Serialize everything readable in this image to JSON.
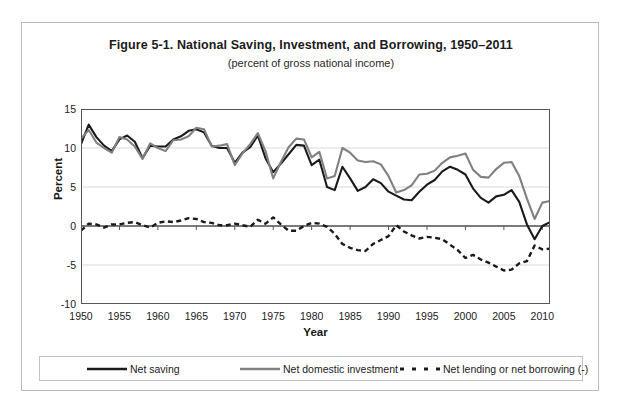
{
  "figure": {
    "title": "Figure 5-1. National Saving, Investment, and Borrowing, 1950–2011",
    "subtitle": "(percent of gross national income)"
  },
  "colors": {
    "net_saving": "#1a1a1a",
    "net_domestic_investment": "#808080",
    "net_lending_or_borrowing": "#1a1a1a",
    "axis": "#555555",
    "gridline": "#d9d9d9",
    "frame": "#b9b9b9",
    "text": "#1b1b1b"
  },
  "chart_data": {
    "type": "line",
    "title": "Figure 5-1. National Saving, Investment, and Borrowing, 1950–2011",
    "subtitle": "(percent of gross national income)",
    "xlabel": "Year",
    "ylabel": "Percent",
    "xlim": [
      1950,
      2011
    ],
    "ylim": [
      -10,
      15
    ],
    "yticks": [
      15,
      10,
      5,
      0,
      -5,
      -10
    ],
    "ytick_labels": [
      "15",
      "10",
      "5",
      "0",
      "-5",
      "-10"
    ],
    "xticks": [
      1950,
      1955,
      1960,
      1965,
      1970,
      1975,
      1980,
      1985,
      1990,
      1995,
      2000,
      2005,
      2010
    ],
    "xtick_labels": [
      "1950",
      "1955",
      "1960",
      "1965",
      "1970",
      "1975",
      "1980",
      "1985",
      "1990",
      "1995",
      "2000",
      "2005",
      "2010"
    ],
    "grid": "horizontal",
    "legend_position": "bottom",
    "x": [
      1950,
      1951,
      1952,
      1953,
      1954,
      1955,
      1956,
      1957,
      1958,
      1959,
      1960,
      1961,
      1962,
      1963,
      1964,
      1965,
      1966,
      1967,
      1968,
      1969,
      1970,
      1971,
      1972,
      1973,
      1974,
      1975,
      1976,
      1977,
      1978,
      1979,
      1980,
      1981,
      1982,
      1983,
      1984,
      1985,
      1986,
      1987,
      1988,
      1989,
      1990,
      1991,
      1992,
      1993,
      1994,
      1995,
      1996,
      1997,
      1998,
      1999,
      2000,
      2001,
      2002,
      2003,
      2004,
      2005,
      2006,
      2007,
      2008,
      2009,
      2010,
      2011
    ],
    "series": [
      {
        "name": "Net saving",
        "style": "solid-thick",
        "color": "#1a1a1a",
        "values": [
          10.5,
          13.0,
          11.4,
          10.3,
          9.6,
          11.1,
          11.6,
          10.8,
          8.7,
          10.3,
          10.2,
          10.2,
          11.1,
          11.5,
          12.2,
          12.4,
          12.0,
          10.3,
          10.0,
          10.0,
          8.1,
          9.4,
          10.1,
          11.6,
          8.7,
          6.9,
          8.0,
          9.2,
          10.4,
          10.3,
          7.8,
          8.5,
          5.0,
          4.6,
          7.6,
          6.1,
          4.5,
          5.0,
          6.0,
          5.5,
          4.4,
          3.9,
          3.4,
          3.3,
          4.4,
          5.3,
          5.9,
          7.0,
          7.6,
          7.2,
          6.6,
          4.8,
          3.6,
          3.0,
          3.8,
          4.0,
          4.6,
          3.1,
          0.2,
          -1.7,
          0.0,
          0.5
        ]
      },
      {
        "name": "Net domestic investment",
        "style": "solid-medium",
        "color": "#808080",
        "values": [
          11.2,
          12.3,
          10.7,
          10.0,
          9.4,
          11.4,
          11.1,
          10.2,
          8.6,
          10.6,
          10.0,
          9.6,
          11.0,
          11.1,
          11.5,
          12.6,
          12.4,
          10.2,
          10.3,
          10.5,
          7.8,
          9.3,
          10.5,
          11.9,
          9.6,
          6.1,
          8.2,
          10.1,
          11.2,
          11.1,
          8.8,
          9.5,
          6.1,
          6.4,
          10.0,
          9.4,
          8.4,
          8.2,
          8.3,
          7.9,
          6.4,
          4.3,
          4.6,
          5.2,
          6.6,
          6.7,
          7.1,
          8.1,
          8.8,
          9.0,
          9.3,
          7.2,
          6.3,
          6.2,
          7.3,
          8.1,
          8.2,
          6.4,
          3.5,
          0.9,
          3.0,
          3.2
        ]
      },
      {
        "name": "Net lending or net borrowing (-)",
        "style": "dashed-thick",
        "color": "#1a1a1a",
        "values": [
          -0.6,
          0.3,
          0.2,
          -0.2,
          0.2,
          0.2,
          0.4,
          0.5,
          0.1,
          -0.2,
          0.4,
          0.6,
          0.5,
          0.7,
          1.0,
          0.9,
          0.5,
          0.4,
          0.1,
          0.1,
          0.3,
          0.1,
          -0.1,
          0.8,
          0.3,
          1.1,
          0.2,
          -0.6,
          -0.6,
          0.0,
          0.4,
          0.3,
          -0.1,
          -1.0,
          -2.3,
          -2.8,
          -3.1,
          -3.2,
          -2.3,
          -1.8,
          -1.3,
          0.1,
          -0.7,
          -1.2,
          -1.6,
          -1.4,
          -1.5,
          -1.7,
          -2.4,
          -3.1,
          -4.1,
          -3.7,
          -4.3,
          -4.7,
          -5.2,
          -5.7,
          -5.6,
          -4.8,
          -4.5,
          -2.5,
          -3.0,
          -2.9
        ]
      }
    ]
  },
  "legend": {
    "items": [
      {
        "label": "Net saving",
        "swatch": "solid-thick-black"
      },
      {
        "label": "Net domestic investment",
        "swatch": "solid-medium-gray"
      },
      {
        "label": "Net lending or net borrowing (-)",
        "swatch": "dashed-black"
      }
    ]
  }
}
